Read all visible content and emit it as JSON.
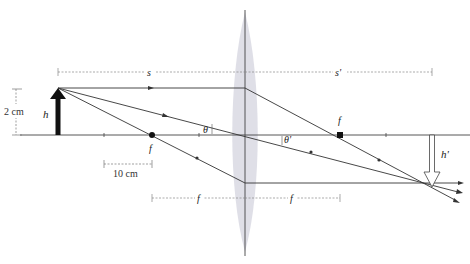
{
  "diagram": {
    "labels": {
      "object_height": "h",
      "image_height": "h'",
      "object_distance": "s",
      "image_distance": "s'",
      "focal_left": "f",
      "focal_right": "f",
      "focal_dim_left": "f",
      "focal_dim_right": "f",
      "angle_left": "θ",
      "angle_right": "θ'",
      "scale_height": "2 cm",
      "scale_length": "10 cm"
    },
    "colors": {
      "line": "#333333",
      "dim_line": "#888888",
      "lens_fill": "#d9d9e3",
      "object_arrow": "#111111",
      "image_arrow_stroke": "#444444"
    },
    "geometry": {
      "axis_y": 135,
      "lens_x": 245,
      "object_x": 58,
      "object_top_y": 88,
      "focal_left_x": 152,
      "focal_right_x": 340,
      "image_x": 432,
      "image_tip_y": 187
    }
  }
}
